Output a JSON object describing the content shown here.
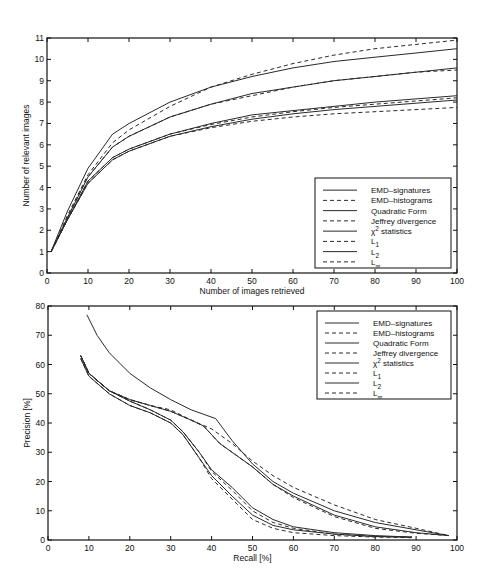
{
  "chart_data": [
    {
      "type": "line",
      "title": "",
      "xlabel": "Number of images retrieved",
      "ylabel": "Number of relevant images",
      "xlim": [
        0,
        100
      ],
      "ylim": [
        0,
        11
      ],
      "xticks": [
        0,
        10,
        20,
        30,
        40,
        50,
        60,
        70,
        80,
        90,
        100
      ],
      "yticks": [
        0,
        1,
        2,
        3,
        4,
        5,
        6,
        7,
        8,
        9,
        10,
        11
      ],
      "grid": false,
      "legend_position": "lower right",
      "x": [
        1,
        5,
        10,
        16,
        20,
        30,
        40,
        50,
        60,
        70,
        80,
        90,
        100
      ],
      "series": [
        {
          "name": "EMD-signatures",
          "style": "solid",
          "values": [
            1,
            2.9,
            4.9,
            6.5,
            7.0,
            8.0,
            8.7,
            9.2,
            9.6,
            9.9,
            10.1,
            10.3,
            10.5
          ]
        },
        {
          "name": "EMD-histograms",
          "style": "dashed",
          "values": [
            1,
            2.7,
            4.6,
            6.1,
            6.7,
            7.8,
            8.7,
            9.3,
            9.8,
            10.2,
            10.5,
            10.7,
            10.9
          ]
        },
        {
          "name": "Quadratic Form",
          "style": "solid",
          "values": [
            1,
            2.6,
            4.5,
            5.9,
            6.4,
            7.3,
            7.9,
            8.4,
            8.7,
            9.0,
            9.2,
            9.4,
            9.6
          ]
        },
        {
          "name": "Jeffrey divergence",
          "style": "dashed",
          "values": [
            1,
            2.6,
            4.5,
            5.9,
            6.4,
            7.3,
            7.9,
            8.3,
            8.7,
            9.0,
            9.2,
            9.4,
            9.5
          ]
        },
        {
          "name": "χ² statistics",
          "style": "solid",
          "values": [
            1,
            2.5,
            4.3,
            5.4,
            5.8,
            6.5,
            7.0,
            7.4,
            7.6,
            7.8,
            8.0,
            8.15,
            8.3
          ]
        },
        {
          "name": "L1",
          "style": "dashed",
          "values": [
            1,
            2.5,
            4.3,
            5.4,
            5.8,
            6.5,
            6.95,
            7.3,
            7.55,
            7.75,
            7.9,
            8.05,
            8.2
          ]
        },
        {
          "name": "L2",
          "style": "solid",
          "values": [
            1,
            2.5,
            4.2,
            5.3,
            5.7,
            6.4,
            6.85,
            7.2,
            7.45,
            7.65,
            7.8,
            7.95,
            8.1
          ]
        },
        {
          "name": "L∞",
          "style": "dashed",
          "values": [
            1,
            2.5,
            4.2,
            5.3,
            5.7,
            6.4,
            6.8,
            7.1,
            7.3,
            7.45,
            7.55,
            7.65,
            7.75
          ]
        }
      ]
    },
    {
      "type": "line",
      "title": "",
      "xlabel": "Recall [%]",
      "ylabel": "Precision [%]",
      "xlim": [
        0,
        100
      ],
      "ylim": [
        0,
        80
      ],
      "xticks": [
        0,
        10,
        20,
        30,
        40,
        50,
        60,
        70,
        80,
        90,
        100
      ],
      "yticks": [
        0,
        10,
        20,
        30,
        40,
        50,
        60,
        70,
        80
      ],
      "grid": false,
      "legend_position": "upper right",
      "series": [
        {
          "name": "EMD-signatures",
          "style": "solid",
          "points": [
            [
              9.5,
              77
            ],
            [
              12,
              70
            ],
            [
              15,
              64
            ],
            [
              20,
              57
            ],
            [
              25,
              52
            ],
            [
              30,
              48
            ],
            [
              35,
              44.5
            ],
            [
              41,
              41.5
            ],
            [
              45,
              34
            ],
            [
              50,
              26
            ],
            [
              55,
              20
            ],
            [
              60,
              16
            ],
            [
              70,
              10
            ],
            [
              80,
              6
            ],
            [
              90,
              3.5
            ],
            [
              98,
              1.5
            ]
          ]
        },
        {
          "name": "EMD-histograms",
          "style": "dashed",
          "points": [
            [
              8,
              63
            ],
            [
              10,
              57
            ],
            [
              15,
              51
            ],
            [
              20,
              48
            ],
            [
              25,
              46
            ],
            [
              30,
              44.5
            ],
            [
              35,
              41
            ],
            [
              40,
              38
            ],
            [
              45,
              33
            ],
            [
              50,
              27
            ],
            [
              55,
              22
            ],
            [
              60,
              18
            ],
            [
              70,
              12
            ],
            [
              80,
              7
            ],
            [
              90,
              4
            ],
            [
              98,
              1.5
            ]
          ]
        },
        {
          "name": "Quadratic Form",
          "style": "solid",
          "points": [
            [
              8,
              63
            ],
            [
              10,
              57
            ],
            [
              15,
              51
            ],
            [
              20,
              48
            ],
            [
              25,
              46
            ],
            [
              30,
              44
            ],
            [
              35,
              41
            ],
            [
              38,
              39
            ],
            [
              42,
              33
            ],
            [
              50,
              25
            ],
            [
              55,
              19
            ],
            [
              60,
              15
            ],
            [
              70,
              8.5
            ],
            [
              80,
              4.5
            ],
            [
              90,
              2.5
            ],
            [
              98,
              1.5
            ]
          ]
        },
        {
          "name": "Jeffrey divergence",
          "style": "dashed",
          "points": [
            [
              8,
              63
            ],
            [
              10,
              57
            ],
            [
              15,
              51
            ],
            [
              20,
              48
            ],
            [
              25,
              46
            ],
            [
              30,
              44
            ],
            [
              35,
              41
            ],
            [
              38,
              39
            ],
            [
              42,
              33
            ],
            [
              50,
              25
            ],
            [
              55,
              19
            ],
            [
              60,
              14.5
            ],
            [
              70,
              8
            ],
            [
              80,
              4
            ],
            [
              90,
              2.3
            ],
            [
              98,
              1.5
            ]
          ]
        },
        {
          "name": "χ² statistics",
          "style": "solid",
          "points": [
            [
              8,
              63
            ],
            [
              10,
              57
            ],
            [
              15,
              51
            ],
            [
              20,
              47.5
            ],
            [
              25,
              44.5
            ],
            [
              30,
              41
            ],
            [
              33,
              37
            ],
            [
              37,
              30
            ],
            [
              40,
              24
            ],
            [
              45,
              18
            ],
            [
              50,
              11
            ],
            [
              55,
              7
            ],
            [
              60,
              4.5
            ],
            [
              70,
              2.5
            ],
            [
              80,
              1.5
            ],
            [
              89,
              1
            ]
          ]
        },
        {
          "name": "L1",
          "style": "dashed",
          "points": [
            [
              8,
              63
            ],
            [
              10,
              57
            ],
            [
              15,
              51
            ],
            [
              20,
              47.5
            ],
            [
              25,
              44.5
            ],
            [
              30,
              41
            ],
            [
              33,
              37
            ],
            [
              37,
              30
            ],
            [
              40,
              23.5
            ],
            [
              45,
              17
            ],
            [
              50,
              10
            ],
            [
              55,
              6
            ],
            [
              60,
              4
            ],
            [
              70,
              2
            ],
            [
              80,
              1.2
            ],
            [
              89,
              1
            ]
          ]
        },
        {
          "name": "L2",
          "style": "solid",
          "points": [
            [
              8,
              62
            ],
            [
              10,
              56
            ],
            [
              15,
              50
            ],
            [
              20,
              46
            ],
            [
              25,
              43.5
            ],
            [
              30,
              40
            ],
            [
              33,
              36
            ],
            [
              37,
              28
            ],
            [
              40,
              22
            ],
            [
              45,
              15
            ],
            [
              50,
              8.5
            ],
            [
              55,
              5
            ],
            [
              60,
              3.5
            ],
            [
              70,
              2
            ],
            [
              80,
              1.2
            ],
            [
              89,
              1
            ]
          ]
        },
        {
          "name": "L∞",
          "style": "dashed",
          "points": [
            [
              8,
              62
            ],
            [
              10,
              56
            ],
            [
              15,
              50
            ],
            [
              20,
              46
            ],
            [
              25,
              43.5
            ],
            [
              30,
              40
            ],
            [
              33,
              36
            ],
            [
              37,
              28
            ],
            [
              40,
              21
            ],
            [
              45,
              14
            ],
            [
              50,
              7
            ],
            [
              55,
              4
            ],
            [
              60,
              2.5
            ],
            [
              70,
              1.5
            ],
            [
              80,
              1
            ],
            [
              89,
              0.8
            ]
          ]
        }
      ]
    }
  ],
  "legend": {
    "entries": [
      {
        "label": "EMD–signatures",
        "style": "solid"
      },
      {
        "label": "EMD–histograms",
        "style": "dashed"
      },
      {
        "label": "Quadratic Form",
        "style": "solid"
      },
      {
        "label": "Jeffrey divergence",
        "style": "dashed"
      },
      {
        "label": "χ² statistics",
        "style": "solid"
      },
      {
        "label": "L1",
        "style": "dashed"
      },
      {
        "label": "L2",
        "style": "solid"
      },
      {
        "label": "L∞",
        "style": "dashed"
      }
    ]
  },
  "colors": {
    "line": "#2a2a2a",
    "frame": "#111111",
    "background": "#ffffff"
  }
}
